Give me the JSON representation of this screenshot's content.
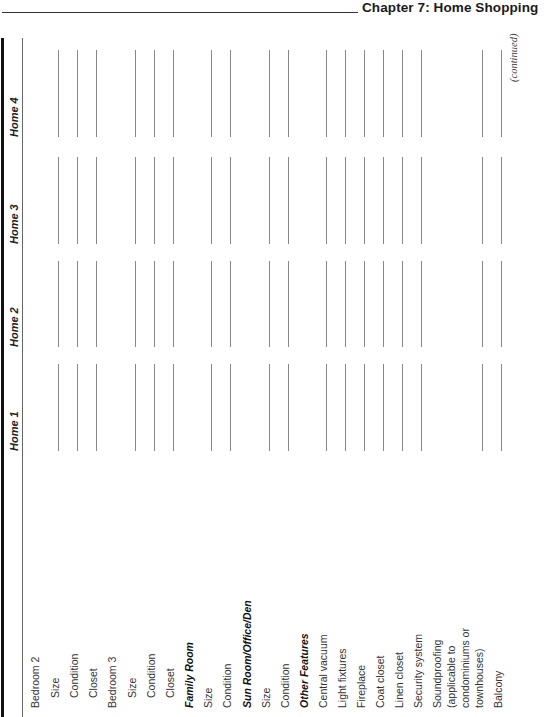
{
  "header": {
    "title": "Chapter 7: Home Shopping"
  },
  "table": {
    "columns": [
      "Home 1",
      "Home 2",
      "Home 3",
      "Home 4"
    ],
    "rows": [
      {
        "label": "Bedroom 2",
        "indent": 0,
        "bold": false,
        "lines": false
      },
      {
        "label": "Size",
        "indent": 2,
        "bold": false,
        "lines": true
      },
      {
        "label": "Condition",
        "indent": 2,
        "bold": false,
        "lines": true
      },
      {
        "label": "Closet",
        "indent": 2,
        "bold": false,
        "lines": true
      },
      {
        "label": "Bedroom 3",
        "indent": 0,
        "bold": false,
        "lines": false
      },
      {
        "label": "Size",
        "indent": 2,
        "bold": false,
        "lines": true
      },
      {
        "label": "Condition",
        "indent": 2,
        "bold": false,
        "lines": true
      },
      {
        "label": "Closet",
        "indent": 2,
        "bold": false,
        "lines": true
      },
      {
        "label": "Family Room",
        "indent": 0,
        "bold": true,
        "lines": false
      },
      {
        "label": "Size",
        "indent": 0,
        "bold": false,
        "lines": true
      },
      {
        "label": "Condition",
        "indent": 0,
        "bold": false,
        "lines": true
      },
      {
        "label": "Sun Room/Office/Den",
        "indent": 0,
        "bold": true,
        "lines": false
      },
      {
        "label": "Size",
        "indent": 0,
        "bold": false,
        "lines": true
      },
      {
        "label": "Condition",
        "indent": 0,
        "bold": false,
        "lines": true
      },
      {
        "label": "Other Features",
        "indent": 0,
        "bold": true,
        "lines": false
      },
      {
        "label": "Central vacuum",
        "indent": 0,
        "bold": false,
        "lines": true
      },
      {
        "label": "Light fixtures",
        "indent": 0,
        "bold": false,
        "lines": true
      },
      {
        "label": "Fireplace",
        "indent": 0,
        "bold": false,
        "lines": true
      },
      {
        "label": "Coat closet",
        "indent": 0,
        "bold": false,
        "lines": true
      },
      {
        "label": "Linen closet",
        "indent": 0,
        "bold": false,
        "lines": true
      },
      {
        "label": "Security system",
        "indent": 0,
        "bold": false,
        "lines": true
      },
      {
        "label": "Soundproofing",
        "indent": 0,
        "bold": false,
        "lines": false
      },
      {
        "label": "(applicable to",
        "indent": 0,
        "bold": false,
        "lines": false
      },
      {
        "label": "condominiums or",
        "indent": 0,
        "bold": false,
        "lines": false
      },
      {
        "label": "townhouses)",
        "indent": 0,
        "bold": false,
        "lines": true
      },
      {
        "label": "Balcony",
        "indent": 0,
        "bold": false,
        "lines": true
      }
    ],
    "footer": "(continued)"
  }
}
